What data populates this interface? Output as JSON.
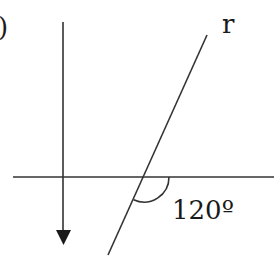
{
  "diagram": {
    "item_label": ")",
    "line_label": "r",
    "angle_label": "120º",
    "angle_value_degrees": 120,
    "colors": {
      "stroke": "#333333",
      "text": "#1a1a1a",
      "background": "#ffffff"
    }
  }
}
